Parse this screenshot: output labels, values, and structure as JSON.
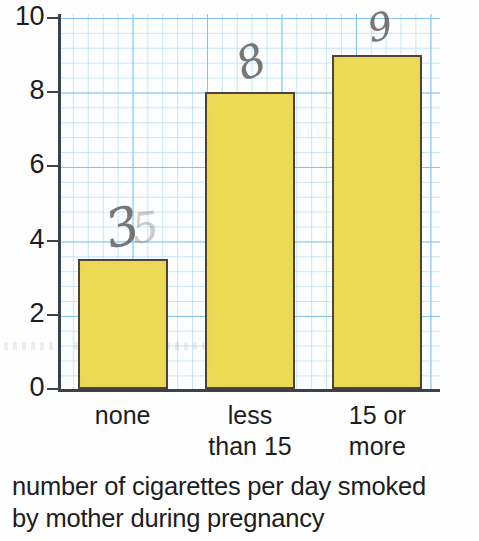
{
  "chart_data": {
    "type": "bar",
    "title": "",
    "subtitle": "",
    "xlabel": "number of cigarettes per day smoked by mother during pregnancy",
    "ylabel": "",
    "categories": [
      "none",
      "less than 15",
      "15 or more"
    ],
    "values": [
      3.5,
      8,
      9
    ],
    "ylim": [
      0,
      10
    ],
    "ytick_labels": [
      "10",
      "8",
      "6",
      "4",
      "2",
      "0"
    ],
    "ytick_values": [
      10,
      8,
      6,
      4,
      2,
      0
    ],
    "grid": true,
    "legend": "none",
    "bar_color": "#eedb55",
    "bar_border_color": "#4a443a",
    "grid_color": "#a8d7f0",
    "grid_major_color": "#78beeb",
    "axis_color": "#3b4249",
    "annotations": [
      {
        "text": "3",
        "ghost_text": "5",
        "category": "none",
        "value": 3.5
      },
      {
        "text": "8",
        "ghost_text": "",
        "category": "less than 15",
        "value": 8
      },
      {
        "text": "9",
        "ghost_text": "",
        "category": "15 or more",
        "value": 9
      }
    ]
  },
  "axis": {
    "y_labels": [
      {
        "text": "10"
      },
      {
        "text": "8"
      },
      {
        "text": "6"
      },
      {
        "text": "4"
      },
      {
        "text": "2"
      },
      {
        "text": "0"
      }
    ]
  },
  "categories": [
    {
      "line1": "none",
      "line2": ""
    },
    {
      "line1": "less",
      "line2": "than 15"
    },
    {
      "line1": "15 or",
      "line2": "more"
    }
  ],
  "annotations": [
    {
      "value": "3",
      "ghost": "5"
    },
    {
      "value": "8",
      "ghost": ""
    },
    {
      "value": "9",
      "ghost": ""
    }
  ],
  "caption": {
    "line1": "number of cigarettes per day smoked",
    "line2": "by mother during pregnancy"
  }
}
